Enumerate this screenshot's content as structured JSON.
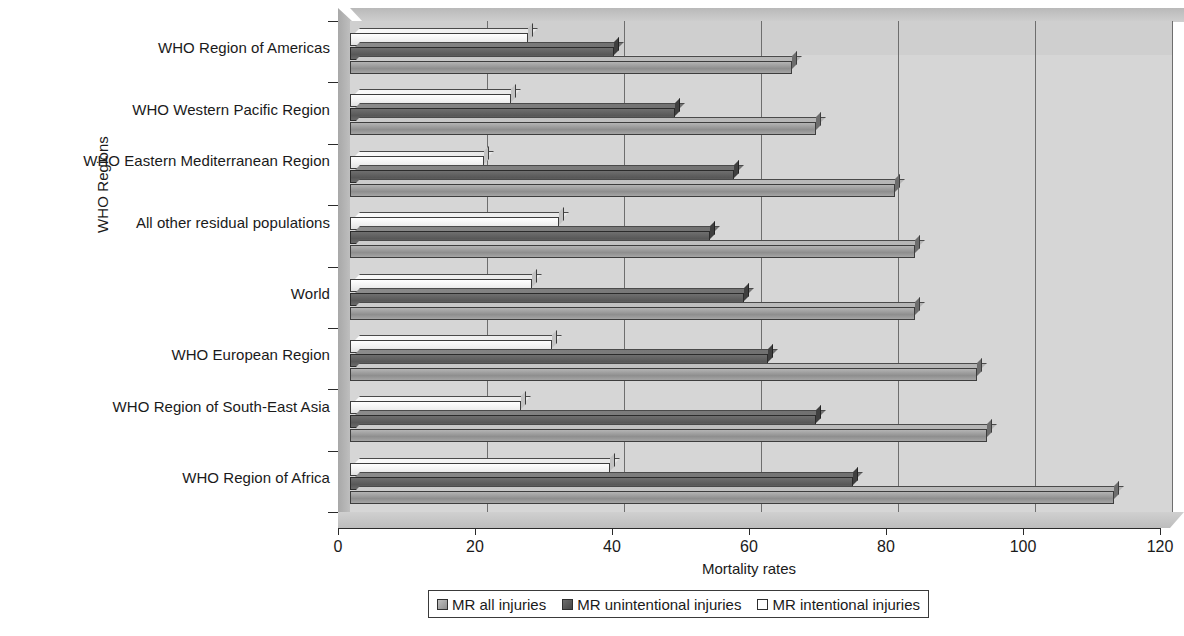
{
  "chart_data": {
    "type": "bar",
    "orientation": "horizontal",
    "title": "",
    "xlabel": "Mortality rates",
    "ylabel": "WHO Regions",
    "xlim": [
      0,
      120
    ],
    "xticks": [
      0,
      20,
      40,
      60,
      80,
      100,
      120
    ],
    "grid": true,
    "legend_position": "bottom",
    "categories": [
      "WHO Region of Americas",
      "WHO Western Pacific Region",
      "WHO Eastern Mediterranean Region",
      "All other residual populations",
      "World",
      "WHO European Region",
      "WHO Region of South-East Asia",
      "WHO Region of Africa"
    ],
    "series": [
      {
        "name": "MR all injuries",
        "color": "#9a9a9a",
        "values": [
          64.5,
          68.0,
          79.5,
          82.5,
          82.5,
          91.5,
          93.0,
          111.5
        ]
      },
      {
        "name": "MR unintentional injuries",
        "color": "#5a5a5a",
        "values": [
          38.5,
          47.5,
          56.0,
          52.5,
          57.5,
          61.0,
          68.0,
          73.5
        ]
      },
      {
        "name": "MR intentional injuries",
        "color": "#ffffff",
        "values": [
          26.0,
          23.5,
          19.5,
          30.5,
          26.5,
          29.5,
          25.0,
          38.0
        ]
      }
    ]
  },
  "axes": {
    "y_title": "WHO Regions",
    "x_title": "Mortality rates",
    "x_tick_labels": [
      "0",
      "20",
      "40",
      "60",
      "80",
      "100",
      "120"
    ]
  },
  "legend": {
    "items": [
      {
        "label": "MR all injuries",
        "swatch": "all"
      },
      {
        "label": "MR unintentional injuries",
        "swatch": "unintentional"
      },
      {
        "label": "MR intentional injuries",
        "swatch": "intentional"
      }
    ]
  }
}
